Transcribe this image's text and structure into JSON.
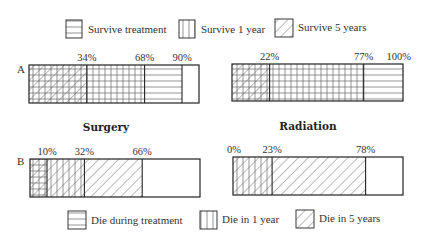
{
  "chart_data": {
    "type": "stacked-bar-diagram",
    "legend_top": [
      {
        "label": "Survive treatment",
        "pattern": "horizontal"
      },
      {
        "label": "Survive 1 year",
        "pattern": "vertical"
      },
      {
        "label": "Survive 5 years",
        "pattern": "diagonal"
      }
    ],
    "legend_bottom": [
      {
        "label": "Die during treatment",
        "pattern": "horizontal"
      },
      {
        "label": "Die in 1 year",
        "pattern": "vertical"
      },
      {
        "label": "Die in 5 years",
        "pattern": "diagonal"
      }
    ],
    "column_titles": [
      "Surgery",
      "Radiation"
    ],
    "rows": [
      {
        "label": "A",
        "bars": [
          {
            "treatment": "Surgery",
            "cutoffs": [
              34,
              68,
              90
            ],
            "tick_labels": [
              "34%",
              "68%",
              "90%"
            ],
            "segments": [
              {
                "from": 0,
                "to": 34,
                "patterns": [
                  "horizontal",
                  "vertical",
                  "diagonal"
                ]
              },
              {
                "from": 34,
                "to": 68,
                "patterns": [
                  "horizontal",
                  "vertical"
                ]
              },
              {
                "from": 68,
                "to": 90,
                "patterns": [
                  "horizontal"
                ]
              },
              {
                "from": 90,
                "to": 100,
                "patterns": []
              }
            ]
          },
          {
            "treatment": "Radiation",
            "cutoffs": [
              22,
              77,
              100
            ],
            "tick_labels": [
              "22%",
              "77%",
              "100%"
            ],
            "segments": [
              {
                "from": 0,
                "to": 22,
                "patterns": [
                  "horizontal",
                  "vertical",
                  "diagonal"
                ]
              },
              {
                "from": 22,
                "to": 77,
                "patterns": [
                  "horizontal",
                  "vertical"
                ]
              },
              {
                "from": 77,
                "to": 100,
                "patterns": [
                  "horizontal"
                ]
              }
            ]
          }
        ]
      },
      {
        "label": "B",
        "bars": [
          {
            "treatment": "Surgery",
            "cutoffs": [
              10,
              32,
              66
            ],
            "tick_labels": [
              "10%",
              "32%",
              "66%"
            ],
            "segments": [
              {
                "from": 0,
                "to": 10,
                "patterns": [
                  "horizontal",
                  "vertical",
                  "diagonal"
                ]
              },
              {
                "from": 10,
                "to": 32,
                "patterns": [
                  "vertical",
                  "diagonal"
                ]
              },
              {
                "from": 32,
                "to": 66,
                "patterns": [
                  "diagonal"
                ]
              },
              {
                "from": 66,
                "to": 100,
                "patterns": []
              }
            ]
          },
          {
            "treatment": "Radiation",
            "cutoffs": [
              0,
              23,
              78
            ],
            "tick_labels": [
              "0%",
              "23%",
              "78%"
            ],
            "segments": [
              {
                "from": 0,
                "to": 23,
                "patterns": [
                  "vertical",
                  "diagonal"
                ]
              },
              {
                "from": 23,
                "to": 78,
                "patterns": [
                  "diagonal"
                ]
              },
              {
                "from": 78,
                "to": 100,
                "patterns": []
              }
            ]
          }
        ]
      }
    ]
  }
}
